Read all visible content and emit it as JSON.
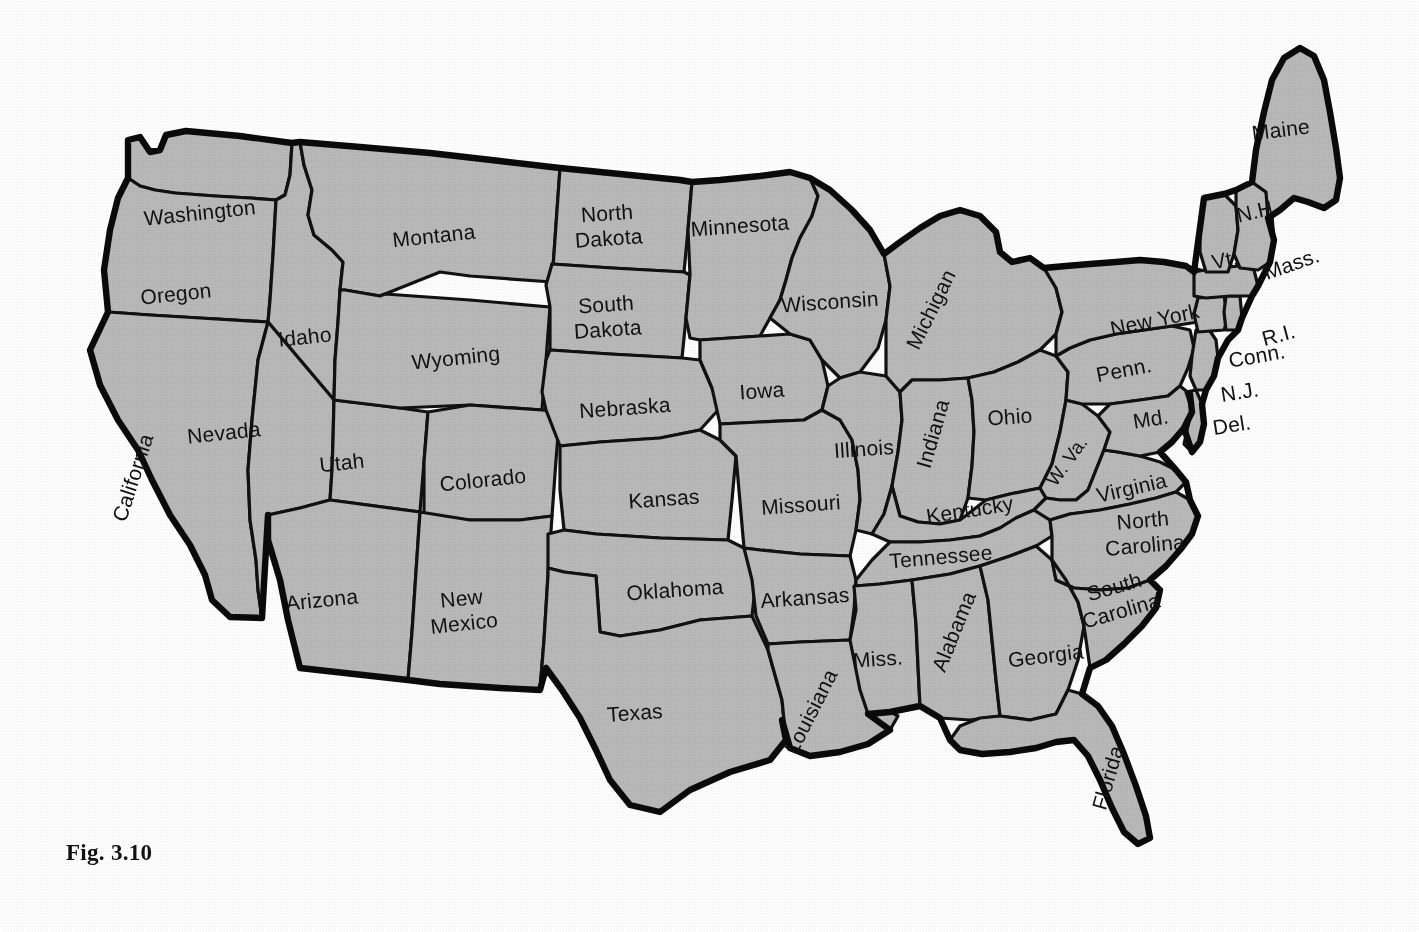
{
  "figure": {
    "caption": "Fig. 3.10",
    "kind": "map"
  },
  "style": {
    "state_fill": "#b9b9b9",
    "border_color": "#111111",
    "outline_color": "#0a0a0a",
    "background": "#ffffff",
    "label_color": "#111111"
  },
  "map": {
    "states": [
      {
        "id": "washington",
        "label": "Washington",
        "lines": [
          "Washington"
        ],
        "x": 200,
        "y": 214,
        "rotate": -6,
        "size": "normal"
      },
      {
        "id": "oregon",
        "label": "Oregon",
        "lines": [
          "Oregon"
        ],
        "x": 176,
        "y": 295,
        "rotate": -6,
        "size": "normal"
      },
      {
        "id": "california",
        "label": "California",
        "lines": [
          "California"
        ],
        "x": 134,
        "y": 478,
        "rotate": -72,
        "size": "normal"
      },
      {
        "id": "nevada",
        "label": "Nevada",
        "lines": [
          "Nevada"
        ],
        "x": 224,
        "y": 434,
        "rotate": -6,
        "size": "normal"
      },
      {
        "id": "idaho",
        "label": "Idaho",
        "lines": [
          "Idaho"
        ],
        "x": 305,
        "y": 338,
        "rotate": -6,
        "size": "normal"
      },
      {
        "id": "montana",
        "label": "Montana",
        "lines": [
          "Montana"
        ],
        "x": 434,
        "y": 237,
        "rotate": -6,
        "size": "normal"
      },
      {
        "id": "wyoming",
        "label": "Wyoming",
        "lines": [
          "Wyoming"
        ],
        "x": 456,
        "y": 359,
        "rotate": -6,
        "size": "normal"
      },
      {
        "id": "utah",
        "label": "Utah",
        "lines": [
          "Utah"
        ],
        "x": 342,
        "y": 464,
        "rotate": -6,
        "size": "normal"
      },
      {
        "id": "colorado",
        "label": "Colorado",
        "lines": [
          "Colorado"
        ],
        "x": 483,
        "y": 481,
        "rotate": -6,
        "size": "normal"
      },
      {
        "id": "arizona",
        "label": "Arizona",
        "lines": [
          "Arizona"
        ],
        "x": 322,
        "y": 601,
        "rotate": -6,
        "size": "normal"
      },
      {
        "id": "new-mexico",
        "label": "New Mexico",
        "lines": [
          "New",
          "Mexico"
        ],
        "x": 463,
        "y": 612,
        "rotate": -6,
        "size": "normal"
      },
      {
        "id": "north-dakota",
        "label": "North Dakota",
        "lines": [
          "North",
          "Dakota"
        ],
        "x": 608,
        "y": 227,
        "rotate": -4,
        "size": "normal"
      },
      {
        "id": "south-dakota",
        "label": "South Dakota",
        "lines": [
          "South",
          "Dakota"
        ],
        "x": 607,
        "y": 318,
        "rotate": -4,
        "size": "normal"
      },
      {
        "id": "nebraska",
        "label": "Nebraska",
        "lines": [
          "Nebraska"
        ],
        "x": 625,
        "y": 409,
        "rotate": -4,
        "size": "normal"
      },
      {
        "id": "kansas",
        "label": "Kansas",
        "lines": [
          "Kansas"
        ],
        "x": 664,
        "y": 500,
        "rotate": -4,
        "size": "normal"
      },
      {
        "id": "oklahoma",
        "label": "Oklahoma",
        "lines": [
          "Oklahoma"
        ],
        "x": 675,
        "y": 591,
        "rotate": -4,
        "size": "normal"
      },
      {
        "id": "texas",
        "label": "Texas",
        "lines": [
          "Texas"
        ],
        "x": 635,
        "y": 714,
        "rotate": -4,
        "size": "normal"
      },
      {
        "id": "minnesota",
        "label": "Minnesota",
        "lines": [
          "Minnesota"
        ],
        "x": 740,
        "y": 227,
        "rotate": -4,
        "size": "normal"
      },
      {
        "id": "iowa",
        "label": "Iowa",
        "lines": [
          "Iowa"
        ],
        "x": 762,
        "y": 392,
        "rotate": -4,
        "size": "normal"
      },
      {
        "id": "missouri",
        "label": "Missouri",
        "lines": [
          "Missouri"
        ],
        "x": 801,
        "y": 506,
        "rotate": -4,
        "size": "normal"
      },
      {
        "id": "arkansas",
        "label": "Arkansas",
        "lines": [
          "Arkansas"
        ],
        "x": 805,
        "y": 599,
        "rotate": -4,
        "size": "normal"
      },
      {
        "id": "louisiana",
        "label": "Louisiana",
        "lines": [
          "Louisiana"
        ],
        "x": 812,
        "y": 712,
        "rotate": -63,
        "size": "normal"
      },
      {
        "id": "wisconsin",
        "label": "Wisconsin",
        "lines": [
          "Wisconsin"
        ],
        "x": 830,
        "y": 303,
        "rotate": -4,
        "size": "normal"
      },
      {
        "id": "illinois",
        "label": "Illinois",
        "lines": [
          "Illinois"
        ],
        "x": 864,
        "y": 450,
        "rotate": -4,
        "size": "normal"
      },
      {
        "id": "mississippi",
        "label": "Miss.",
        "lines": [
          "Miss."
        ],
        "x": 878,
        "y": 660,
        "rotate": -4,
        "size": "normal"
      },
      {
        "id": "michigan",
        "label": "Michigan",
        "lines": [
          "Michigan"
        ],
        "x": 932,
        "y": 310,
        "rotate": -64,
        "size": "normal"
      },
      {
        "id": "indiana",
        "label": "Indiana",
        "lines": [
          "Indiana"
        ],
        "x": 934,
        "y": 434,
        "rotate": -74,
        "size": "normal"
      },
      {
        "id": "kentucky",
        "label": "Kentucky",
        "lines": [
          "Kentucky"
        ],
        "x": 970,
        "y": 511,
        "rotate": -9,
        "size": "normal"
      },
      {
        "id": "tennessee",
        "label": "Tennessee",
        "lines": [
          "Tennessee"
        ],
        "x": 941,
        "y": 558,
        "rotate": -5,
        "size": "normal"
      },
      {
        "id": "alabama",
        "label": "Alabama",
        "lines": [
          "Alabama"
        ],
        "x": 955,
        "y": 632,
        "rotate": -68,
        "size": "normal"
      },
      {
        "id": "georgia",
        "label": "Georgia",
        "lines": [
          "Georgia"
        ],
        "x": 1046,
        "y": 657,
        "rotate": -7,
        "size": "normal"
      },
      {
        "id": "florida",
        "label": "Florida",
        "lines": [
          "Florida"
        ],
        "x": 1109,
        "y": 778,
        "rotate": -74,
        "size": "normal"
      },
      {
        "id": "ohio",
        "label": "Ohio",
        "lines": [
          "Ohio"
        ],
        "x": 1010,
        "y": 418,
        "rotate": -4,
        "size": "normal"
      },
      {
        "id": "west-virginia",
        "label": "W. Va.",
        "lines": [
          "W. Va."
        ],
        "x": 1068,
        "y": 462,
        "rotate": -54,
        "size": "small"
      },
      {
        "id": "virginia",
        "label": "Virginia",
        "lines": [
          "Virginia"
        ],
        "x": 1132,
        "y": 489,
        "rotate": -13,
        "size": "normal"
      },
      {
        "id": "north-carolina",
        "label": "North Carolina",
        "lines": [
          "North",
          "Carolina"
        ],
        "x": 1144,
        "y": 534,
        "rotate": -5,
        "size": "normal"
      },
      {
        "id": "south-carolina",
        "label": "South Carolina",
        "lines": [
          "South",
          "Carolina"
        ],
        "x": 1118,
        "y": 600,
        "rotate": -16,
        "size": "normal"
      },
      {
        "id": "pennsylvania",
        "label": "Penn.",
        "lines": [
          "Penn."
        ],
        "x": 1124,
        "y": 371,
        "rotate": -11,
        "size": "normal"
      },
      {
        "id": "new-york",
        "label": "New York",
        "lines": [
          "New York"
        ],
        "x": 1155,
        "y": 321,
        "rotate": -12,
        "size": "normal"
      },
      {
        "id": "maryland",
        "label": "Md.",
        "lines": [
          "Md."
        ],
        "x": 1151,
        "y": 420,
        "rotate": -9,
        "size": "normal"
      },
      {
        "id": "maine",
        "label": "Maine",
        "lines": [
          "Maine"
        ],
        "x": 1281,
        "y": 131,
        "rotate": -7,
        "size": "normal"
      },
      {
        "id": "new-hampshire",
        "label": "N.H.",
        "lines": [
          "N.H."
        ],
        "x": 1258,
        "y": 212,
        "rotate": -13,
        "size": "normal"
      },
      {
        "id": "vermont",
        "label": "Vt.",
        "lines": [
          "Vt."
        ],
        "x": 1225,
        "y": 261,
        "rotate": -12,
        "size": "normal"
      },
      {
        "id": "massachusetts",
        "label": "Mass.",
        "lines": [
          "Mass."
        ],
        "x": 1292,
        "y": 265,
        "rotate": -19,
        "size": "normal"
      },
      {
        "id": "rhode-island",
        "label": "R.I.",
        "lines": [
          "R.I."
        ],
        "x": 1279,
        "y": 336,
        "rotate": -15,
        "size": "normal"
      },
      {
        "id": "connecticut",
        "label": "Conn.",
        "lines": [
          "Conn."
        ],
        "x": 1257,
        "y": 357,
        "rotate": -10,
        "size": "normal"
      },
      {
        "id": "new-jersey",
        "label": "N.J.",
        "lines": [
          "N.J."
        ],
        "x": 1240,
        "y": 393,
        "rotate": -9,
        "size": "normal"
      },
      {
        "id": "delaware",
        "label": "Del.",
        "lines": [
          "Del."
        ],
        "x": 1232,
        "y": 426,
        "rotate": -9,
        "size": "normal"
      }
    ]
  }
}
